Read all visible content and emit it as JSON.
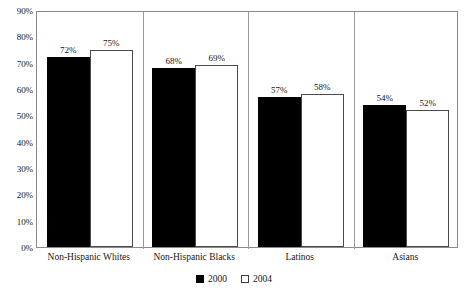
{
  "chart_data": {
    "type": "bar",
    "title": "",
    "subtitle": "",
    "xlabel": "",
    "ylabel": "",
    "ylim": [
      0,
      90
    ],
    "y_tick_labels": [
      "90%",
      "80%",
      "70%",
      "60%",
      "50%",
      "40%",
      "30%",
      "20%",
      "10%",
      "0%"
    ],
    "y_tick_values": [
      90,
      80,
      70,
      60,
      50,
      40,
      30,
      20,
      10,
      0
    ],
    "grid": false,
    "legend_position": "bottom-center",
    "categories": [
      "Non-Hispanic Whites",
      "Non-Hispanic Blacks",
      "Latinos",
      "Asians"
    ],
    "series": [
      {
        "name": "2000",
        "color": "#000000",
        "values": [
          72,
          68,
          57,
          54
        ],
        "data_labels": [
          "72%",
          "68%",
          "57%",
          "54%"
        ]
      },
      {
        "name": "2004",
        "color": "#ffffff",
        "values": [
          75,
          69,
          58,
          52
        ],
        "data_labels": [
          "75%",
          "69%",
          "58%",
          "52%"
        ]
      }
    ]
  },
  "legend": {
    "items": [
      {
        "label": "2000",
        "swatch": "filled-black-square"
      },
      {
        "label": "2004",
        "swatch": "open-white-square"
      }
    ]
  },
  "colors": {
    "series_2000": "#000000",
    "series_2004": "#ffffff",
    "frame": "#8a8a8a",
    "separator": "#9a9a9a",
    "text": "#161616"
  }
}
